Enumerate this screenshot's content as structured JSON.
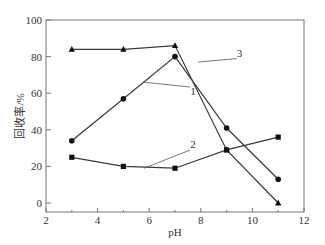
{
  "chart_data": {
    "type": "line",
    "title": "",
    "xlabel": "pH",
    "ylabel": "回收率/%",
    "xlim": [
      2,
      12
    ],
    "ylim": [
      0,
      100
    ],
    "xticks": [
      2,
      4,
      6,
      8,
      10,
      12
    ],
    "yticks": [
      0,
      20,
      40,
      60,
      80,
      100
    ],
    "grid": false,
    "legend": "inline numeric labels (1, 2, 3) with leader lines",
    "x": [
      3,
      5,
      7,
      9,
      11
    ],
    "series": [
      {
        "name": "1",
        "marker": "circle",
        "values": [
          34,
          57,
          80,
          41,
          13
        ]
      },
      {
        "name": "2",
        "marker": "square",
        "values": [
          25,
          20,
          19,
          29,
          36
        ]
      },
      {
        "name": "3",
        "marker": "triangle",
        "values": [
          84,
          84,
          86,
          29,
          0
        ]
      }
    ],
    "annotations": [
      {
        "text": "1",
        "x": 7.7,
        "y": 59,
        "leader_from": [
          5.8,
          66
        ]
      },
      {
        "text": "2",
        "x": 7.7,
        "y": 30,
        "leader_from": [
          5.8,
          19
        ]
      },
      {
        "text": "3",
        "x": 9.5,
        "y": 80,
        "leader_from": [
          7.9,
          77
        ]
      }
    ],
    "colors": {
      "line": "#3a3a3a",
      "marker": "#111111",
      "frame": "#777777"
    }
  }
}
